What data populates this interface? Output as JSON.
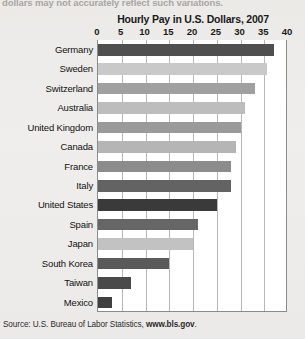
{
  "page": {
    "cut_caption": "dollars may not accurately reflect such variations.",
    "source_prefix": "Source: U.S. Bureau of Labor Statistics, ",
    "source_link": "www.bls.gov",
    "source_suffix": "."
  },
  "chart_data": {
    "type": "bar",
    "orientation": "horizontal",
    "title": "Hourly Pay in U.S. Dollars, 2007",
    "xlabel": "",
    "ylabel": "",
    "xlim": [
      0,
      40
    ],
    "ticks": [
      0,
      5,
      10,
      15,
      20,
      25,
      30,
      35,
      40
    ],
    "tick_labels": [
      "0",
      "5",
      "10",
      "15",
      "20",
      "25",
      "30",
      "35",
      "40"
    ],
    "grid": true,
    "legend": "none",
    "categories": [
      "Germany",
      "Sweden",
      "Switzerland",
      "Australia",
      "United Kingdom",
      "Canada",
      "France",
      "Italy",
      "United States",
      "Spain",
      "Japan",
      "South Korea",
      "Taiwan",
      "Mexico"
    ],
    "values": [
      37,
      35.5,
      33,
      31,
      30,
      29,
      28,
      28,
      25,
      21,
      20,
      15,
      7,
      3
    ],
    "bar_colors": [
      "#4f4f4f",
      "#c9c9c9",
      "#a0a0a0",
      "#bdbdbd",
      "#9a9a9a",
      "#b5b5b5",
      "#8c8c8c",
      "#636363",
      "#3a3a3a",
      "#666666",
      "#c2c2c2",
      "#5a5a5a",
      "#4a4a4a",
      "#3f3f3f"
    ]
  }
}
